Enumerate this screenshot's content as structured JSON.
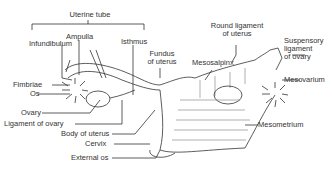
{
  "diagram": {
    "labels": {
      "uterine_tube": "Uterine tube",
      "ampulla": "Ampulla",
      "infundibulum": "Infundibulum",
      "isthmus": "Isthmus",
      "fundus_line1": "Fundus",
      "fundus_line2": "of uterus",
      "round_ligament_line1": "Round ligament",
      "round_ligament_line2": "of uterus",
      "mesosalpinx": "Mesosalpinx",
      "suspensory_line1": "Suspensory",
      "suspensory_line2": "ligament",
      "suspensory_line3": "of ovary",
      "mesovarium": "Mesovarium",
      "mesometrium": "Mesometrium",
      "fimbriae": "Fimbriae",
      "os": "Os",
      "ovary": "Ovary",
      "ligament_of_ovary": "Ligament of ovary",
      "body_of_uterus": "Body of uterus",
      "cervix": "Cervix",
      "external_os": "External os"
    },
    "colors": {
      "line": "#333333",
      "background": "#ffffff"
    }
  }
}
